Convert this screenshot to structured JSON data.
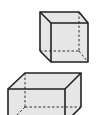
{
  "diagram": {
    "shapes": [
      {
        "name": "cube",
        "fill": "#e6e6e6",
        "stroke": "#222222"
      },
      {
        "name": "rectangular-prism",
        "fill": "#e6e6e6",
        "stroke": "#222222"
      }
    ]
  }
}
